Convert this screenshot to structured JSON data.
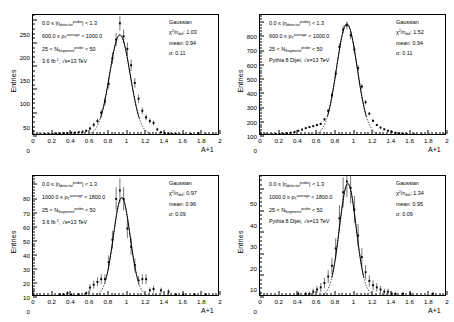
{
  "figure": {
    "layout": "2x2",
    "background": "#ffffff",
    "axis_color": "#000000",
    "marker_color": "#000000",
    "fit_color": "#000000"
  },
  "axes": {
    "xlabel": "A+1",
    "ylabel": "Entries",
    "xticks": [
      "0",
      "0.2",
      "0.4",
      "0.6",
      "0.8",
      "1",
      "1.2",
      "1.4",
      "1.6",
      "1.8",
      "2"
    ],
    "xlim": [
      0,
      2
    ]
  },
  "chart_data": [
    {
      "id": "top-left",
      "type": "line",
      "title": "",
      "xlabel": "A+1",
      "ylabel": "Entries",
      "xlim": [
        0,
        2
      ],
      "ylim": [
        0,
        260
      ],
      "yticks": [
        "0",
        "50",
        "100",
        "150",
        "200",
        "250"
      ],
      "ytick_values": [
        0,
        50,
        100,
        150,
        200,
        250
      ],
      "grid": false,
      "legend_position": "top-right",
      "annotations": [
        "0.0 ≤ |η_detector^probe| < 1.3",
        "600.0 ≤ p_T^average < 1000.0",
        "25 < N_Segments^probe < 50",
        "3.6 fb⁻¹, √s=13 TeV"
      ],
      "legend": {
        "label": "Gaussian",
        "chi2": "χ²/n_dof: 1.03",
        "mean": "mean: 0.94",
        "sigma": "σ: 0.11"
      },
      "fit": {
        "amplitude": 215,
        "mean": 0.94,
        "sigma": 0.11
      },
      "x": [
        0.02,
        0.06,
        0.1,
        0.14,
        0.18,
        0.22,
        0.26,
        0.3,
        0.34,
        0.38,
        0.42,
        0.46,
        0.5,
        0.54,
        0.58,
        0.62,
        0.66,
        0.7,
        0.74,
        0.78,
        0.82,
        0.86,
        0.9,
        0.94,
        0.98,
        1.02,
        1.06,
        1.1,
        1.14,
        1.18,
        1.22,
        1.26,
        1.3,
        1.34,
        1.38,
        1.42,
        1.46,
        1.5,
        1.54,
        1.58,
        1.62,
        1.7,
        1.78,
        1.86,
        1.94
      ],
      "y": [
        1,
        1,
        1,
        2,
        2,
        2,
        3,
        3,
        4,
        4,
        5,
        5,
        6,
        7,
        9,
        14,
        22,
        30,
        48,
        72,
        110,
        165,
        205,
        240,
        212,
        185,
        150,
        112,
        78,
        52,
        38,
        30,
        26,
        12,
        6,
        4,
        3,
        2,
        2,
        1,
        1,
        2,
        4,
        1,
        1
      ]
    },
    {
      "id": "top-right",
      "type": "line",
      "title": "",
      "xlabel": "A+1",
      "ylabel": "Entries",
      "xlim": [
        0,
        2
      ],
      "ylim": [
        0,
        850
      ],
      "yticks": [
        "0",
        "100",
        "200",
        "300",
        "400",
        "500",
        "600",
        "700",
        "800"
      ],
      "ytick_values": [
        0,
        100,
        200,
        300,
        400,
        500,
        600,
        700,
        800
      ],
      "grid": false,
      "legend_position": "top-right",
      "annotations": [
        "0.0 ≤ |η_detector^probe| < 1.3",
        "600.0 ≤ p_T^average < 1000.0",
        "25 < N_Segments^probe < 50",
        "Pythia 8 Dijet, √s=13 TeV"
      ],
      "legend": {
        "label": "Gaussian",
        "chi2": "χ²/n_dof: 1.52",
        "mean": "mean: 0.94",
        "sigma": "σ: 0.11"
      },
      "fit": {
        "amplitude": 780,
        "mean": 0.94,
        "sigma": 0.11
      },
      "x": [
        0.02,
        0.06,
        0.1,
        0.14,
        0.18,
        0.22,
        0.26,
        0.3,
        0.34,
        0.38,
        0.42,
        0.46,
        0.5,
        0.54,
        0.58,
        0.62,
        0.66,
        0.7,
        0.74,
        0.78,
        0.82,
        0.86,
        0.9,
        0.94,
        0.98,
        1.02,
        1.06,
        1.1,
        1.14,
        1.18,
        1.22,
        1.26,
        1.3,
        1.34,
        1.38,
        1.42,
        1.46,
        1.5,
        1.54,
        1.58,
        1.66,
        1.74,
        1.82,
        1.9,
        1.98
      ],
      "y": [
        4,
        4,
        4,
        5,
        6,
        7,
        9,
        12,
        16,
        22,
        30,
        38,
        48,
        56,
        62,
        70,
        78,
        110,
        170,
        280,
        430,
        620,
        740,
        770,
        700,
        600,
        470,
        340,
        230,
        150,
        100,
        70,
        52,
        40,
        30,
        22,
        16,
        12,
        9,
        7,
        5,
        4,
        4,
        3,
        3
      ]
    },
    {
      "id": "bottom-left",
      "type": "line",
      "title": "",
      "xlabel": "A+1",
      "ylabel": "Entries",
      "xlim": [
        0,
        2
      ],
      "ylim": [
        0,
        86
      ],
      "yticks": [
        "0",
        "10",
        "20",
        "30",
        "40",
        "50",
        "60",
        "70",
        "80"
      ],
      "ytick_values": [
        0,
        10,
        20,
        30,
        40,
        50,
        60,
        70,
        80
      ],
      "grid": false,
      "legend_position": "top-right",
      "annotations": [
        "0.0 ≤ |η_detector^probe| < 1.3",
        "1000.0 ≤ p_T^average < 1800.0",
        "25 < N_Segments^probe < 50",
        "3.6 fb⁻¹, √s=13 TeV"
      ],
      "legend": {
        "label": "Gaussian",
        "chi2": "χ²/n_dof: 0.97",
        "mean": "mean: 0.96",
        "sigma": "σ: 0.09"
      },
      "fit": {
        "amplitude": 70,
        "mean": 0.96,
        "sigma": 0.09
      },
      "x": [
        0.3,
        0.34,
        0.38,
        0.42,
        0.5,
        0.58,
        0.62,
        0.66,
        0.7,
        0.74,
        0.78,
        0.82,
        0.86,
        0.9,
        0.94,
        0.98,
        1.02,
        1.06,
        1.1,
        1.14,
        1.18,
        1.22,
        1.26,
        1.3,
        1.38,
        1.46,
        1.54,
        1.62,
        1.74,
        1.86
      ],
      "y": [
        1,
        1,
        2,
        1,
        1,
        2,
        6,
        8,
        10,
        12,
        12,
        24,
        40,
        69,
        75,
        69,
        48,
        35,
        22,
        11,
        12,
        12,
        4,
        5,
        4,
        3,
        1,
        1,
        1,
        1
      ]
    },
    {
      "id": "bottom-right",
      "type": "line",
      "title": "",
      "xlabel": "A+1",
      "ylabel": "Entries",
      "xlim": [
        0,
        2
      ],
      "ylim": [
        0,
        56
      ],
      "yticks": [
        "0",
        "10",
        "20",
        "30",
        "40",
        "50"
      ],
      "ytick_values": [
        0,
        10,
        20,
        30,
        40,
        50
      ],
      "grid": false,
      "legend_position": "top-right",
      "annotations": [
        "0.0 ≤ |η_detector^probe| < 1.3",
        "1000.0 ≤ p_T^average < 1800.0",
        "25 < N_Segments^probe < 50",
        "Pythia 8 Dijet, √s=13 TeV"
      ],
      "legend": {
        "label": "Gaussian",
        "chi2": "χ²/n_dof: 1.34",
        "mean": "mean: 0.95",
        "sigma": "σ: 0.09"
      },
      "fit": {
        "amplitude": 52,
        "mean": 0.95,
        "sigma": 0.09
      },
      "x": [
        0.02,
        0.1,
        0.18,
        0.26,
        0.34,
        0.42,
        0.5,
        0.54,
        0.58,
        0.62,
        0.66,
        0.7,
        0.74,
        0.78,
        0.82,
        0.86,
        0.9,
        0.94,
        0.98,
        1.02,
        1.06,
        1.1,
        1.14,
        1.18,
        1.22,
        1.26,
        1.3,
        1.34,
        1.38,
        1.42,
        1.46,
        1.54,
        1.62,
        1.7,
        1.78,
        1.86,
        1.94
      ],
      "y": [
        0,
        0,
        0,
        0,
        0,
        1,
        1,
        1,
        2,
        3,
        4,
        6,
        9,
        14,
        22,
        36,
        48,
        53,
        50,
        40,
        28,
        18,
        11,
        7,
        5,
        4,
        3,
        2,
        2,
        1,
        1,
        1,
        1,
        0,
        0,
        1,
        0
      ]
    }
  ]
}
